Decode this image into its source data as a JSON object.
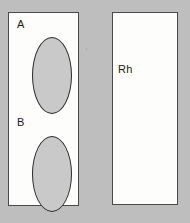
{
  "figure": {
    "name": "blood-typing-agglutination-card",
    "background_color": "#bebebe"
  },
  "panels": [
    {
      "id": "abo",
      "name": "abo-typing-panel",
      "background_color": "#fdfdfc",
      "border_color": "#4a4a4a",
      "wells": [
        {
          "id": "a",
          "label": "A",
          "fill_color": "#c9c9c9",
          "outline_color": "#2b2b2b",
          "shape": "ellipse"
        },
        {
          "id": "b",
          "label": "B",
          "fill_color": "#c9c9c9",
          "outline_color": "#2b2b2b",
          "shape": "ellipse"
        }
      ]
    },
    {
      "id": "rh",
      "name": "rh-typing-panel",
      "background_color": "#fdfdfc",
      "border_color": "#4a4a4a",
      "wells": [
        {
          "id": "rh",
          "label": "Rh",
          "fill_color": "#c9c9c9",
          "outline_color": "#2b2b2b",
          "shape": "ellipse"
        }
      ]
    }
  ],
  "marks": [
    {
      "id": "speck",
      "name": "stray-speck",
      "color": "#a9a9a9"
    }
  ]
}
